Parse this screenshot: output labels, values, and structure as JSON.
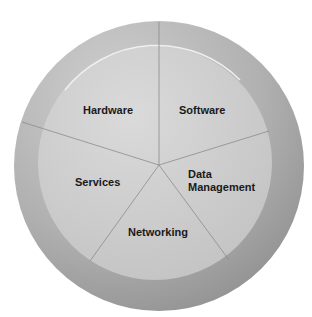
{
  "diagram": {
    "type": "segmented-wheel",
    "segments": [
      {
        "label": "Hardware"
      },
      {
        "label": "Software"
      },
      {
        "label": "Data Management",
        "lines": [
          "Data",
          "Management"
        ]
      },
      {
        "label": "Networking"
      },
      {
        "label": "Services"
      }
    ],
    "colors": {
      "outer_ring": "#9c9c9c",
      "outer_ring_light": "#c4c4c4",
      "inner_disk": "#c8c8c8",
      "inner_disk_light": "#d8d8d8",
      "divider": "#8a8a8a",
      "text": "#1a1a1a"
    }
  }
}
